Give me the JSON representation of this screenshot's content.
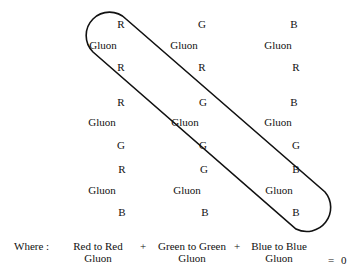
{
  "grid": {
    "columns": [
      {
        "blocks": [
          {
            "top": "R",
            "middle": "Gluon",
            "bottom": "R"
          },
          {
            "top": "R",
            "middle": "Gluon",
            "bottom": "G"
          },
          {
            "top": "R",
            "middle": "Gluon",
            "bottom": "B"
          }
        ]
      },
      {
        "blocks": [
          {
            "top": "G",
            "middle": "Gluon",
            "bottom": "R"
          },
          {
            "top": "G",
            "middle": "Gluon",
            "bottom": "G"
          },
          {
            "top": "G",
            "middle": "Gluon",
            "bottom": "B"
          }
        ]
      },
      {
        "blocks": [
          {
            "top": "B",
            "middle": "Gluon",
            "bottom": "R"
          },
          {
            "top": "B",
            "middle": "Gluon",
            "bottom": "G"
          },
          {
            "top": "B",
            "middle": "Gluon",
            "bottom": "B"
          }
        ]
      }
    ]
  },
  "highlight": {
    "description": "Capsule enclosing the diagonal color-anticolor gluons R-R, G-G, B-B"
  },
  "equation": {
    "prefix": "Where :",
    "terms": [
      {
        "line1": "Red to Red",
        "line2": "Gluon"
      },
      {
        "line1": "Green to Green",
        "line2": "Gluon"
      },
      {
        "line1": "Blue to Blue",
        "line2": "Gluon"
      }
    ],
    "operator": "+",
    "equals": "=",
    "result": "0"
  }
}
